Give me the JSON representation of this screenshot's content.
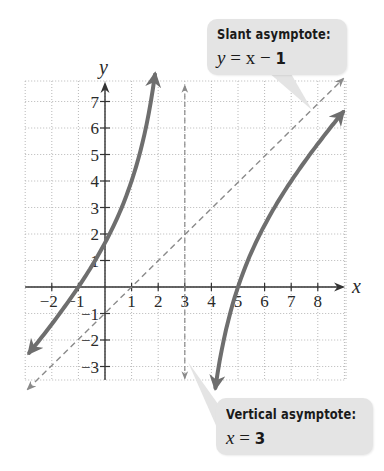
{
  "chart_data": {
    "type": "line",
    "title": "",
    "function": "f(x) = (x^2 - 4x - 5)/(x - 3)",
    "xlabel": "x",
    "ylabel": "y",
    "xlim": [
      -3,
      9
    ],
    "ylim": [
      -3.5,
      7.8
    ],
    "grid": true,
    "x_ticks": [
      -2,
      -1,
      1,
      2,
      3,
      4,
      5,
      6,
      7,
      8
    ],
    "y_ticks": [
      -3,
      -2,
      -1,
      1,
      2,
      3,
      4,
      5,
      6,
      7
    ],
    "series": [
      {
        "name": "left branch",
        "x": [
          -2.9,
          -2,
          -1,
          0,
          1,
          1.5,
          1.9
        ],
        "y": [
          -2.54,
          -1.4,
          0,
          1.67,
          4,
          5.83,
          8.17
        ]
      },
      {
        "name": "right branch",
        "x": [
          4.15,
          4.5,
          5,
          6,
          7,
          8,
          9
        ],
        "y": [
          -3.81,
          -1.83,
          0,
          2.33,
          4,
          5.4,
          6.67
        ]
      }
    ],
    "asymptotes": [
      {
        "type": "slant",
        "equation": "y = x - 1",
        "style": "dashed"
      },
      {
        "type": "vertical",
        "equation": "x = 3",
        "style": "dashed"
      }
    ],
    "annotations": [
      {
        "title": "Slant asymptote:",
        "equation_var": "y",
        "equation_rest": " = x − ",
        "equation_num": "1"
      },
      {
        "title": "Vertical asymptote:",
        "equation_var": "x",
        "equation_rest": " = ",
        "equation_num": "3"
      }
    ]
  },
  "colors": {
    "curve": "#6e6e6e",
    "asymptote": "#8a8a8a",
    "axis": "#333333",
    "grid": "#b8b8b8",
    "callout_bg": "#e4e4e4"
  },
  "callouts": {
    "slant": {
      "title": "Slant asymptote:",
      "var": "y",
      "mid": " = x − ",
      "num": "1"
    },
    "vertical": {
      "title": "Vertical asymptote:",
      "var": "x",
      "mid": " = ",
      "num": "3"
    }
  },
  "axes": {
    "x_label": "x",
    "y_label": "y"
  }
}
